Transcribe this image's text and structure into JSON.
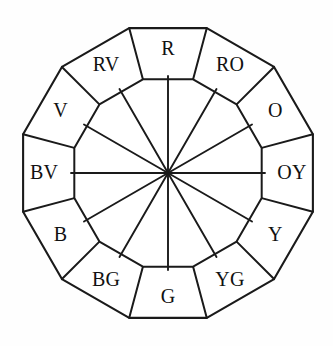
{
  "diagram": {
    "shape": "dodecagon",
    "geometry": {
      "center_x": 168,
      "center_y": 173,
      "outer_radius": 150,
      "inner_radius": 97,
      "label_radius": 124,
      "segment_count": 12,
      "rotation_offset_deg": -90
    },
    "style": {
      "stroke_color": "#1a1a1a",
      "fill_color": "#ffffff",
      "background_color": "#fefefe",
      "label_color": "#111111",
      "stroke_width": 2.0,
      "label_font_size": 20
    },
    "segments": [
      {
        "label": "R",
        "name": "red",
        "index": 0
      },
      {
        "label": "RO",
        "name": "red-orange",
        "index": 1
      },
      {
        "label": "O",
        "name": "orange",
        "index": 2
      },
      {
        "label": "OY",
        "name": "orange-yellow",
        "index": 3
      },
      {
        "label": "Y",
        "name": "yellow",
        "index": 4
      },
      {
        "label": "YG",
        "name": "yellow-green",
        "index": 5
      },
      {
        "label": "G",
        "name": "green",
        "index": 6
      },
      {
        "label": "BG",
        "name": "blue-green",
        "index": 7
      },
      {
        "label": "B",
        "name": "blue",
        "index": 8
      },
      {
        "label": "BV",
        "name": "blue-violet",
        "index": 9
      },
      {
        "label": "V",
        "name": "violet",
        "index": 10
      },
      {
        "label": "RV",
        "name": "red-violet",
        "index": 11
      }
    ]
  }
}
